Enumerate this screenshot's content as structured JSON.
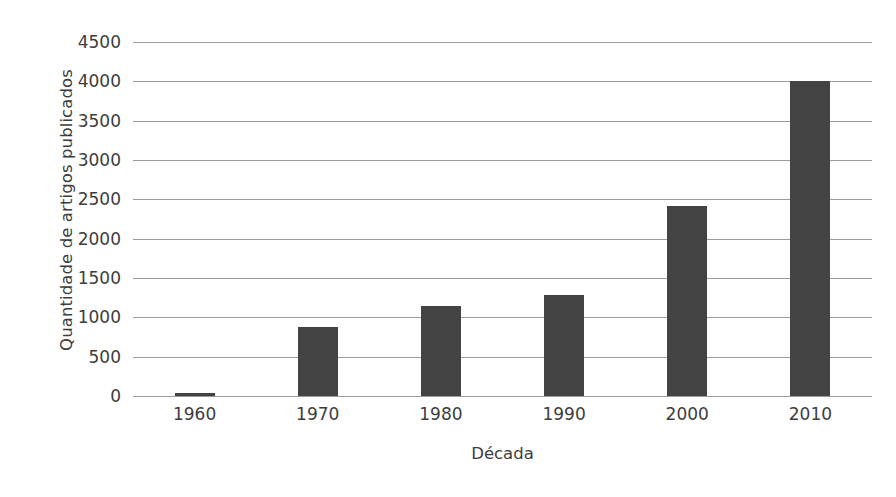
{
  "chart_data": {
    "type": "bar",
    "title": "",
    "subtitle": "",
    "xlabel": "Década",
    "ylabel": "Quantidade de artigos publicados",
    "categories": [
      "1960",
      "1970",
      "1980",
      "1990",
      "2000",
      "2010"
    ],
    "values": [
      40,
      880,
      1140,
      1290,
      2410,
      4000
    ],
    "series": [
      {
        "name": "Quantidade de artigos publicados",
        "values": [
          40,
          880,
          1140,
          1290,
          2410,
          4000
        ]
      }
    ],
    "ylim": [
      0,
      4500
    ],
    "ytick_values": [
      0,
      500,
      1000,
      1500,
      2000,
      2500,
      3000,
      3500,
      4000,
      4500
    ],
    "ytick_labels": [
      "0",
      "500",
      "1000",
      "1500",
      "2000",
      "2500",
      "3000",
      "3500",
      "4000",
      "4500"
    ],
    "xtick_labels": [
      "1960",
      "1970",
      "1980",
      "1990",
      "2000",
      "2010"
    ],
    "grid": true,
    "grid_axis": "y",
    "legend": false,
    "legend_position": "none",
    "bar_color": "#434343",
    "grid_color": "#8a8a8a",
    "background_color": "#ffffff",
    "text_color": "#3d3d3d",
    "annotations": []
  }
}
